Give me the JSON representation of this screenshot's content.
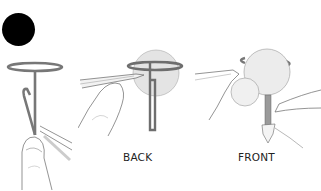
{
  "figure": {
    "step_badge": {
      "shape": "filled-circle",
      "color": "#000000"
    },
    "panels": [
      {
        "id": "step-1",
        "label": "",
        "description": "Wire with loop at top being bent into a hook, held between fingers"
      },
      {
        "id": "back",
        "label": "BACK",
        "description": "Wire loop shown behind a bead/ball, hand with pliers tip pressing the hook"
      },
      {
        "id": "front",
        "label": "FRONT",
        "description": "Two balls on wire stem, loop visible behind, hands holding the stem"
      }
    ],
    "colors": {
      "wire": "#7a7a7a",
      "ball": "#e6e6e6",
      "outline": "#555555",
      "badge": "#000000",
      "text": "#222222"
    }
  }
}
